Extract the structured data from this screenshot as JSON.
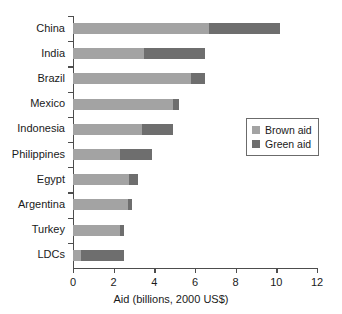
{
  "chart_data": {
    "type": "bar",
    "orientation": "horizontal",
    "stacked": true,
    "title": "",
    "xlabel": "Aid (billions, 2000 US$)",
    "ylabel": "",
    "xlim": [
      0,
      12
    ],
    "xticks": [
      0,
      2,
      4,
      6,
      8,
      10,
      12
    ],
    "xtick_labels": [
      "0",
      "2",
      "4",
      "6",
      "8",
      "10",
      "12"
    ],
    "grid": false,
    "legend_position": "center-right",
    "categories": [
      "China",
      "India",
      "Brazil",
      "Mexico",
      "Indonesia",
      "Philippines",
      "Egypt",
      "Argentina",
      "Turkey",
      "LDCs"
    ],
    "series": [
      {
        "name": "Brown aid",
        "color": "#a3a3a3",
        "values": [
          6.7,
          3.5,
          5.8,
          4.9,
          3.4,
          2.3,
          2.75,
          2.7,
          2.3,
          0.4
        ]
      },
      {
        "name": "Green aid",
        "color": "#6e6e6e",
        "values": [
          3.5,
          3.0,
          0.7,
          0.3,
          1.5,
          1.6,
          0.45,
          0.2,
          0.2,
          2.1
        ]
      }
    ],
    "totals": [
      10.2,
      6.5,
      6.5,
      5.2,
      4.9,
      3.9,
      3.2,
      2.9,
      2.5,
      2.5
    ]
  },
  "legend": {
    "items": [
      {
        "label": "Brown aid",
        "swatch": "brown"
      },
      {
        "label": "Green aid",
        "swatch": "green"
      }
    ]
  },
  "colors": {
    "brown_aid": "#a3a3a3",
    "green_aid": "#6e6e6e",
    "axis": "#4d4d4d",
    "text": "#1a1a1a",
    "background": "#ffffff"
  }
}
